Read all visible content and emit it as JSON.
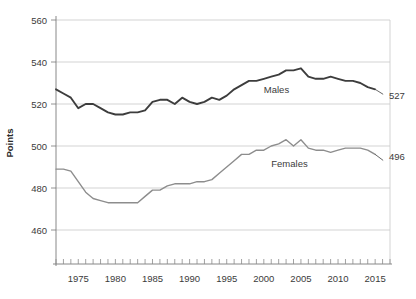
{
  "chart_data": {
    "type": "line",
    "title": "",
    "xlabel": "",
    "ylabel": "Points",
    "ylim": [
      450,
      560
    ],
    "xlim": [
      1972,
      2017
    ],
    "grid": true,
    "legend_position": "inline-annotation",
    "y_ticks": [
      "560",
      "540",
      "520",
      "500",
      "480",
      "460"
    ],
    "y_tick_values": [
      560,
      540,
      520,
      500,
      480,
      460
    ],
    "x_ticks": [
      "1975",
      "1980",
      "1985",
      "1990",
      "1995",
      "2000",
      "2005",
      "2010",
      "2015"
    ],
    "x_tick_values": [
      1975,
      1980,
      1985,
      1990,
      1995,
      2000,
      2005,
      2010,
      2015
    ],
    "x": [
      1972,
      1973,
      1974,
      1975,
      1976,
      1977,
      1978,
      1979,
      1980,
      1981,
      1982,
      1983,
      1984,
      1985,
      1986,
      1987,
      1988,
      1989,
      1990,
      1991,
      1992,
      1993,
      1994,
      1995,
      1996,
      1997,
      1998,
      1999,
      2000,
      2001,
      2002,
      2003,
      2004,
      2005,
      2006,
      2007,
      2008,
      2009,
      2010,
      2011,
      2012,
      2013,
      2014,
      2015
    ],
    "series": [
      {
        "name": "Males",
        "color": "#3d3d3d",
        "end_value": 527,
        "end_label": "527",
        "label": "Males",
        "values": [
          527,
          525,
          523,
          518,
          520,
          520,
          518,
          516,
          515,
          515,
          516,
          516,
          517,
          521,
          522,
          522,
          520,
          523,
          521,
          520,
          521,
          523,
          522,
          524,
          527,
          529,
          531,
          531,
          532,
          533,
          534,
          536,
          536,
          537,
          533,
          532,
          532,
          533,
          532,
          531,
          531,
          530,
          528,
          527
        ]
      },
      {
        "name": "Females",
        "color": "#8d8d8d",
        "end_value": 496,
        "end_label": "496",
        "label": "Females",
        "values": [
          489,
          489,
          488,
          483,
          478,
          475,
          474,
          473,
          473,
          473,
          473,
          473,
          476,
          479,
          479,
          481,
          482,
          482,
          482,
          483,
          483,
          484,
          487,
          490,
          493,
          496,
          496,
          498,
          498,
          500,
          501,
          503,
          500,
          503,
          499,
          498,
          498,
          497,
          498,
          499,
          499,
          499,
          498,
          496
        ]
      }
    ],
    "annotations": [
      {
        "text": "Males",
        "x": 2000,
        "y": 527
      },
      {
        "text": "Females",
        "x": 2001,
        "y": 492
      }
    ]
  },
  "axis": {
    "y_title": "Points"
  }
}
